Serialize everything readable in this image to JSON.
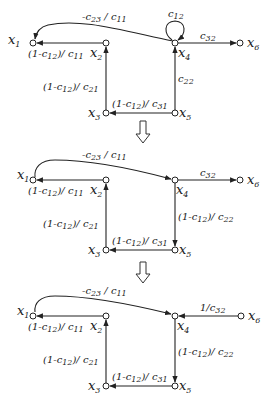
{
  "diagrams": [
    {
      "nodes": {
        "x1": "x",
        "x2": "x",
        "x3": "x",
        "x4": "x",
        "x5": "x",
        "x6": "x"
      },
      "node_subs": {
        "x1": "1",
        "x2": "2",
        "x3": "3",
        "x4": "4",
        "x5": "5",
        "x6": "6"
      },
      "edges": {
        "x4_x1": {
          "pre": "-c",
          "sub": "23",
          "mid": " / c",
          "sub2": "11"
        },
        "x4_self": {
          "pre": "c",
          "sub": "12"
        },
        "x4_x6": {
          "pre": "c",
          "sub": "32"
        },
        "x2_x1": {
          "pre": "(1-c",
          "sub": "12",
          "mid": ")/ c",
          "sub2": "11"
        },
        "x3_x2": {
          "pre": "(1-c",
          "sub": "12",
          "mid": ")/ c",
          "sub2": "21"
        },
        "x5_x3": {
          "pre": "(1-c",
          "sub": "12",
          "mid": ")/ c",
          "sub2": "31"
        },
        "x5_x4": {
          "pre": "c",
          "sub": "22"
        }
      }
    },
    {
      "edges": {
        "x1_x4": {
          "pre": "-c",
          "sub": "23",
          "mid": " / c",
          "sub2": "11"
        },
        "x4_x6": {
          "pre": "c",
          "sub": "32"
        },
        "x2_x1": {
          "pre": "(1-c",
          "sub": "12",
          "mid": ")/ c",
          "sub2": "11"
        },
        "x3_x2": {
          "pre": "(1-c",
          "sub": "12",
          "mid": ")/ c",
          "sub2": "21"
        },
        "x5_x3": {
          "pre": "(1-c",
          "sub": "12",
          "mid": ")/ c",
          "sub2": "31"
        },
        "x4_x5": {
          "pre": "(1-c",
          "sub": "12",
          "mid": ")/ c",
          "sub2": "22"
        }
      }
    },
    {
      "edges": {
        "x1_x4": {
          "pre": "-c",
          "sub": "23",
          "mid": " / c",
          "sub2": "11"
        },
        "x6_x4": {
          "pre": "1/c",
          "sub": "32"
        },
        "x2_x1": {
          "pre": "(1-c",
          "sub": "12",
          "mid": ")/ c",
          "sub2": "11"
        },
        "x3_x2": {
          "pre": "(1-c",
          "sub": "12",
          "mid": ")/ c",
          "sub2": "21"
        },
        "x5_x3": {
          "pre": "(1-c",
          "sub": "12",
          "mid": ")/ c",
          "sub2": "31"
        },
        "x4_x5": {
          "pre": "(1-c",
          "sub": "12",
          "mid": ")/ c",
          "sub2": "22"
        }
      }
    }
  ],
  "transform_arrows": [
    "down-arrow-1",
    "down-arrow-2"
  ],
  "colors": {
    "ink": "#222222",
    "background": "#ffffff"
  }
}
